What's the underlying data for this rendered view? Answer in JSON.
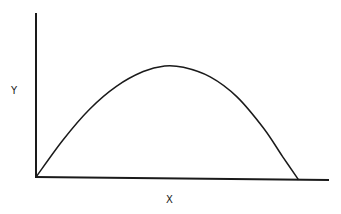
{
  "chart_data": {
    "type": "line",
    "title": "",
    "xlabel": "X",
    "ylabel": "Y",
    "grid": false,
    "legend": null,
    "ticks": false,
    "x_range": [
      0,
      1
    ],
    "y_range": [
      0,
      1
    ],
    "series": [
      {
        "name": "curve",
        "x": [
          0.0,
          0.1,
          0.2,
          0.3,
          0.4,
          0.48,
          0.55,
          0.65,
          0.75,
          0.85,
          0.92,
          0.98
        ],
        "y": [
          0.0,
          0.32,
          0.59,
          0.79,
          0.92,
          0.97,
          0.96,
          0.88,
          0.71,
          0.44,
          0.2,
          0.0
        ]
      }
    ]
  }
}
